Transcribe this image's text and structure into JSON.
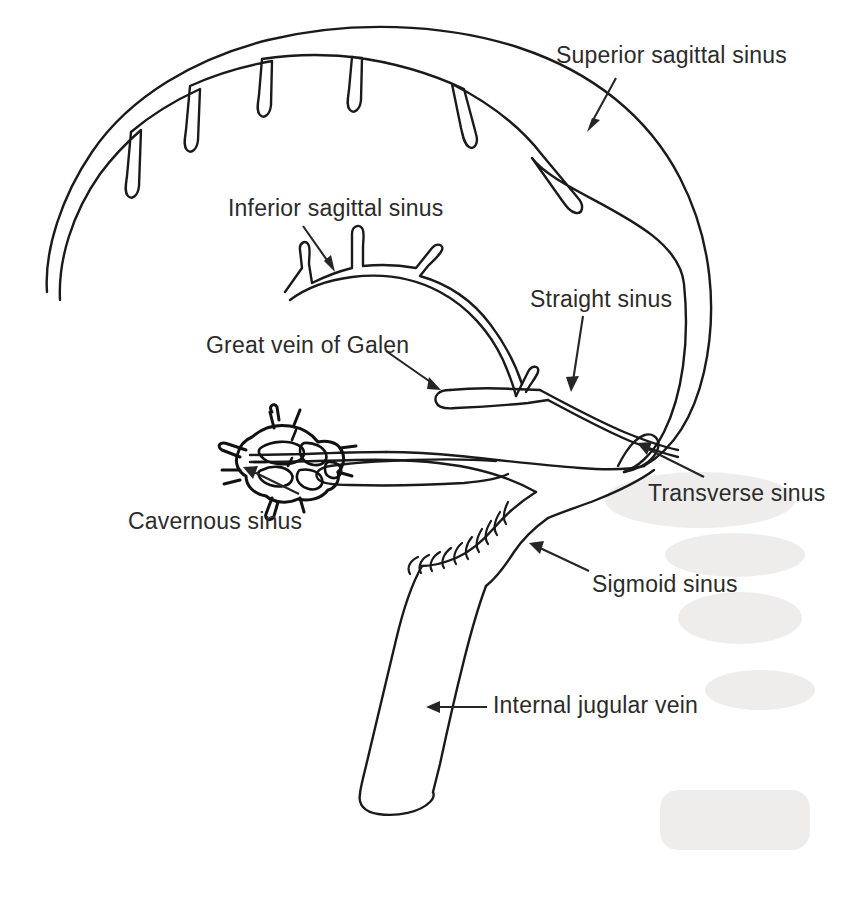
{
  "figure": {
    "ink_color": "#1a1a1a",
    "text_color": "#2b2b2b",
    "background_color": "#ffffff",
    "width": 843,
    "height": 899
  },
  "labels": [
    {
      "id": "superior-sagittal-sinus",
      "text": "Superior sagittal sinus",
      "x": 556,
      "y": 44,
      "leader": {
        "x1": 604,
        "y1": 78,
        "x2": 588,
        "y2": 126
      },
      "arrow_direction": "down-left"
    },
    {
      "id": "inferior-sagittal-sinus",
      "text": "Inferior sagittal sinus",
      "x": 228,
      "y": 197,
      "leader": {
        "x1": 305,
        "y1": 227,
        "x2": 333,
        "y2": 265
      },
      "arrow_direction": "down-right"
    },
    {
      "id": "straight-sinus",
      "text": "Straight sinus",
      "x": 530,
      "y": 288,
      "leader": {
        "x1": 590,
        "y1": 316,
        "x2": 575,
        "y2": 388
      },
      "arrow_direction": "down"
    },
    {
      "id": "great-vein-of-galen",
      "text": "Great vein of Galen",
      "x": 206,
      "y": 334,
      "leader": {
        "x1": 388,
        "y1": 352,
        "x2": 438,
        "y2": 387
      },
      "arrow_direction": "down-right"
    },
    {
      "id": "cavernous-sinus",
      "text": "Cavernous sinus",
      "x": 128,
      "y": 510,
      "leader": {
        "x1": 295,
        "y1": 492,
        "x2": 248,
        "y2": 470
      },
      "arrow_direction": "up-right"
    },
    {
      "id": "transverse-sinus",
      "text": "Transverse sinus",
      "x": 648,
      "y": 482,
      "leader": {
        "x1": 700,
        "y1": 475,
        "x2": 640,
        "y2": 445
      },
      "arrow_direction": "up-left"
    },
    {
      "id": "sigmoid-sinus",
      "text": "Sigmoid sinus",
      "x": 592,
      "y": 573,
      "leader": {
        "x1": 586,
        "y1": 570,
        "x2": 530,
        "y2": 545
      },
      "arrow_direction": "up-left"
    },
    {
      "id": "internal-jugular-vein",
      "text": "Internal jugular vein",
      "x": 493,
      "y": 694,
      "leader": {
        "x1": 484,
        "y1": 708,
        "x2": 430,
        "y2": 708
      },
      "arrow_direction": "left"
    }
  ],
  "structures": [
    {
      "id": "superior-sagittal-sinus-arc",
      "name": "Superior sagittal sinus",
      "lacunae_count": 6
    },
    {
      "id": "inferior-sagittal-sinus-arc",
      "name": "Inferior sagittal sinus",
      "branch_count": 3
    },
    {
      "id": "great-vein-of-galen-trunk",
      "name": "Great vein of Galen"
    },
    {
      "id": "straight-sinus-limb",
      "name": "Straight sinus"
    },
    {
      "id": "confluence-of-sinuses",
      "name": "Confluence of sinuses (torcular)"
    },
    {
      "id": "transverse-sinus-limb",
      "name": "Transverse sinus"
    },
    {
      "id": "sigmoid-sinus-curve",
      "name": "Sigmoid sinus",
      "hatch_marks": 10
    },
    {
      "id": "internal-jugular-vein-trunk",
      "name": "Internal jugular vein"
    },
    {
      "id": "cavernous-sinus-plexus",
      "name": "Cavernous sinus",
      "trabeculae": true
    },
    {
      "id": "superior-petrosal-sinus-loop",
      "name": "Superior petrosal sinus loop"
    }
  ]
}
